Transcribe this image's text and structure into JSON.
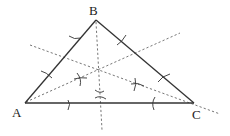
{
  "diagram": {
    "title": "",
    "vertices": [
      {
        "id": "A",
        "label": "A"
      },
      {
        "id": "B",
        "label": "B"
      },
      {
        "id": "C",
        "label": "C"
      }
    ],
    "sides": [
      {
        "from": "A",
        "to": "B"
      },
      {
        "from": "B",
        "to": "C"
      },
      {
        "from": "A",
        "to": "C"
      }
    ],
    "construction": "perpendicular bisectors of the three sides (dashed) meeting at one point, with compass arcs",
    "perpendicular_bisectors": [
      {
        "side": "AC"
      },
      {
        "side": "AB"
      },
      {
        "side": "BC"
      }
    ],
    "colors": {
      "sides": "#333333",
      "bisectors": "#666666",
      "background": "#ffffff"
    }
  }
}
